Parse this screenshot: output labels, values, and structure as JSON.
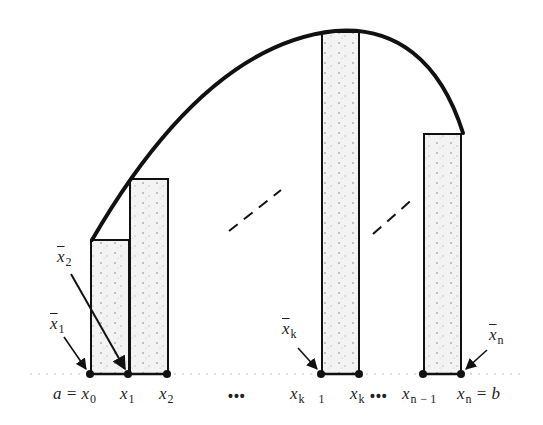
{
  "diagram": {
    "type": "riemann-sum-midpoint-illustration",
    "colors": {
      "ink": "#111111",
      "fill": "#f1f1f1",
      "fill_speckle": "#9a9a9a",
      "background": "#ffffff"
    },
    "partition_labels": {
      "x0": {
        "prefix": "a = ",
        "var": "x",
        "sub": "0"
      },
      "x1": {
        "var": "x",
        "sub": "1"
      },
      "x2": {
        "var": "x",
        "sub": "2"
      },
      "xk_minus_1": {
        "var": "x",
        "sub_k": "k",
        "sub_minus": "1"
      },
      "xk": {
        "var": "x",
        "sub": "k"
      },
      "xn_minus_1": {
        "var": "x",
        "sub": "n",
        "sub_minus": "− 1"
      },
      "xn": {
        "var": "x",
        "sub": "n",
        "suffix": " = b"
      }
    },
    "sample_point_labels": {
      "xbar1": {
        "var": "x",
        "sub": "1"
      },
      "xbar2": {
        "var": "x",
        "sub": "2"
      },
      "xbark": {
        "var": "x",
        "sub": "k"
      },
      "xbarn": {
        "var": "x",
        "sub": "n"
      }
    },
    "ellipses": {
      "left": "•••",
      "right": "•••"
    }
  }
}
